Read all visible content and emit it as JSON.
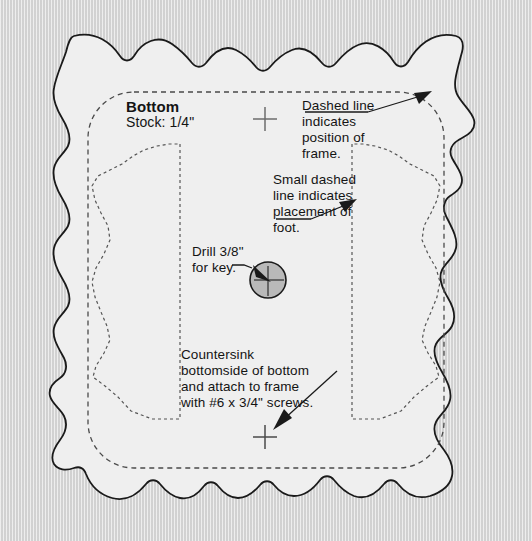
{
  "document": {
    "kind": "woodworking-plan",
    "part_title": "Bottom",
    "stock_label": "Stock: 1/4\""
  },
  "colors": {
    "page_background": "#d9d9d9",
    "panel_fill": "#efefef",
    "outline": "#1a1a1a",
    "dashed_guide": "#4a4a4a",
    "dotted_guide": "#555555",
    "text": "#141414",
    "drill_fill": "#b8b8b8",
    "crosshair": "#6d6d6d"
  },
  "labels": {
    "part_title": "Bottom",
    "stock": "Stock: 1/4\""
  },
  "annotations": [
    {
      "id": "frame-note",
      "text": "Dashed line\nindicates\nposition of\nframe.",
      "lines": [
        "Dashed line",
        "indicates",
        "position of",
        "frame."
      ],
      "leader": {
        "from": [
          370,
          109
        ],
        "to": [
          432,
          93
        ]
      }
    },
    {
      "id": "foot-note",
      "text": "Small dashed\nline indicates\nplacement of\nfoot.",
      "lines": [
        "Small dashed",
        "line indicates",
        "placement of",
        "foot."
      ],
      "leader": {
        "from": [
          329,
          214
        ],
        "to": [
          364,
          199
        ]
      }
    },
    {
      "id": "drill-note",
      "text": "Drill 3/8\"\nfor key.",
      "lines": [
        "Drill 3/8\"",
        "for key."
      ],
      "leader": {
        "from": [
          244,
          263
        ],
        "to": [
          269,
          277
        ]
      }
    },
    {
      "id": "countersink-note",
      "text": "Countersink\nbottomside of bottom\nand attach to frame\nwith #6 x 3/4\" screws.",
      "lines": [
        "Countersink",
        "bottomside of bottom",
        "and attach to frame",
        "with #6 x 3/4\" screws."
      ],
      "leader": {
        "from": [
          332,
          372
        ],
        "to": [
          273,
          431
        ]
      }
    }
  ],
  "features": {
    "drill_hole": {
      "name": "drill-3-8-key-hole",
      "center": [
        268,
        280
      ],
      "radius": 18,
      "spec": "3/8\""
    },
    "crosshairs": [
      {
        "name": "crosshair-top",
        "center": [
          265,
          119
        ],
        "arm": 12
      },
      {
        "name": "crosshair-bottom",
        "center": [
          265,
          437
        ],
        "arm": 12
      }
    ],
    "frame_guide": {
      "name": "frame-position-guide",
      "style": "dashed",
      "rect": [
        88,
        92,
        356,
        376
      ],
      "corner_radius": 46
    },
    "foot_guides": [
      {
        "name": "foot-placement-left",
        "style": "small-dashed"
      },
      {
        "name": "foot-placement-right",
        "style": "small-dashed"
      }
    ],
    "panel_outline": {
      "name": "scalloped-bottom-panel",
      "style": "solid",
      "description": "scalloped ogee-edged square panel"
    }
  }
}
